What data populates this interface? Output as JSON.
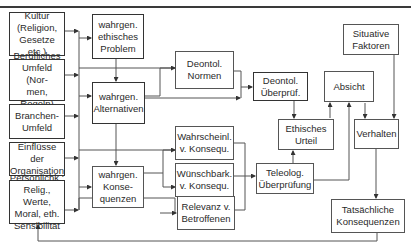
{
  "diagram": {
    "nodes": {
      "kultur": "Kultur\n(Religion,\nGesetze etc.)",
      "berufliches_umfeld": "Berufliches\nUmfeld (Nor-\nmen, Regeln)",
      "branchen_umfeld": "Branchen-\nUmfeld",
      "einfluesse_organisation": "Einflüsse der\nOrganisation",
      "persoenlichkeit": "Persönlichk.:\nRelig., Werte,\nMoral, eth.\nSensibilität",
      "ethisches_problem": "wahrgen.\nethisches\nProblem",
      "alternativen": "wahrgen.\nAlternativen",
      "konsequenzen": "wahrgen.\nKonse-\nquenzen",
      "deontol_normen": "Deontol.\nNormen",
      "wahrscheinlichkeit": "Wahrscheinl.\nv. Konsequ.",
      "wuenschbarkeit": "Wünschbark.\nv. Konsequ.",
      "relevanz": "Relevanz v.\nBetroffenen",
      "deontol_ueberpruefung": "Deontol.\nÜberprüf.",
      "teleolog_ueberpruefung": "Teleolog.\nÜberprüfung",
      "ethisches_urteil": "Ethisches\nUrteil",
      "absicht": "Absicht",
      "situative_faktoren": "Situative\nFaktoren",
      "verhalten": "Verhalten",
      "tatsaechliche_konsequenzen": "Tatsächliche\nKonsequenzen"
    },
    "edges": [
      [
        "environment",
        "ethisches_problem"
      ],
      [
        "ethisches_problem",
        "alternativen"
      ],
      [
        "alternativen",
        "konsequenzen"
      ],
      [
        "alternativen",
        "deontol_normen"
      ],
      [
        "alternativen",
        "deontol_ueberpruefung"
      ],
      [
        "deontol_normen",
        "deontol_ueberpruefung"
      ],
      [
        "konsequenzen",
        "wahrscheinlichkeit"
      ],
      [
        "konsequenzen",
        "wuenschbarkeit"
      ],
      [
        "environment",
        "relevanz"
      ],
      [
        "wahrscheinlichkeit",
        "teleolog_ueberpruefung"
      ],
      [
        "wuenschbarkeit",
        "teleolog_ueberpruefung"
      ],
      [
        "relevanz",
        "teleolog_ueberpruefung"
      ],
      [
        "deontol_ueberpruefung",
        "ethisches_urteil"
      ],
      [
        "teleolog_ueberpruefung",
        "ethisches_urteil"
      ],
      [
        "ethisches_urteil",
        "absicht"
      ],
      [
        "teleolog_ueberpruefung",
        "absicht"
      ],
      [
        "absicht",
        "verhalten"
      ],
      [
        "situative_faktoren",
        "verhalten"
      ],
      [
        "verhalten",
        "tatsaechliche_konsequenzen"
      ],
      [
        "tatsaechliche_konsequenzen",
        "persoenlichkeit"
      ]
    ]
  }
}
